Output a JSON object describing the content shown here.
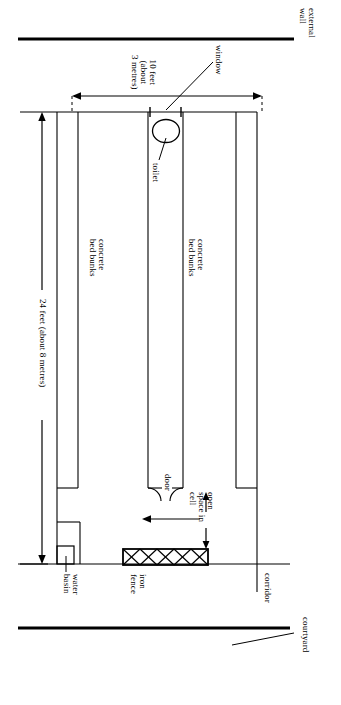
{
  "diagram": {
    "orientation": "rotated-90",
    "stroke_color": "#000000",
    "background_color": "#ffffff",
    "labels": {
      "external_wall": "external\nwall",
      "window": "window",
      "width_dimension": "10 feet\n(about\n3 metres)",
      "toilet": "toilet",
      "bed_bunks_left": "concrete\nbed bunks",
      "bed_bunks_right": "concrete\nbed bunks",
      "length_dimension": "24 feet (about 8 metres)",
      "door": "door",
      "open_space": "open\nspace in\ncell",
      "water_basin": "water\nbasin",
      "iron_fence": "iron\nfence",
      "corridor": "corridor",
      "courtyard": "courtyard"
    }
  }
}
